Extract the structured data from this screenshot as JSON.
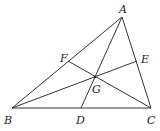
{
  "diagram": {
    "type": "triangle-cevians",
    "points": {
      "A": {
        "label": "A",
        "x": 122,
        "y": 17,
        "lx": 119,
        "ly": 13
      },
      "B": {
        "label": "B",
        "x": 12,
        "y": 108,
        "lx": 4,
        "ly": 124
      },
      "C": {
        "label": "C",
        "x": 151,
        "y": 108,
        "lx": 147,
        "ly": 124
      },
      "D": {
        "label": "D",
        "x": 81,
        "y": 108,
        "lx": 76,
        "ly": 124
      },
      "E": {
        "label": "E",
        "x": 137,
        "y": 61,
        "lx": 141,
        "ly": 63
      },
      "F": {
        "label": "F",
        "x": 68,
        "y": 61,
        "lx": 60,
        "ly": 62
      },
      "G": {
        "label": "G",
        "x": 95,
        "y": 77,
        "lx": 92,
        "ly": 93
      }
    },
    "segments": [
      [
        "A",
        "B"
      ],
      [
        "B",
        "C"
      ],
      [
        "C",
        "A"
      ],
      [
        "A",
        "D"
      ],
      [
        "B",
        "E"
      ],
      [
        "C",
        "F"
      ]
    ]
  }
}
